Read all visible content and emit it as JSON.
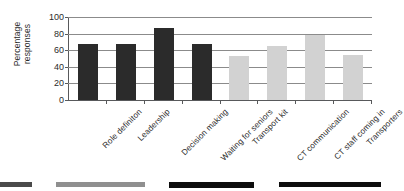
{
  "chart_data": {
    "type": "bar",
    "title": "",
    "subtitle": "",
    "xlabel": "",
    "ylabel": "Percentage\nresponses",
    "ylim": [
      0,
      100
    ],
    "yticks": [
      0,
      20,
      40,
      60,
      80,
      100
    ],
    "grid": true,
    "legend": "none",
    "categories": [
      "Role definiton",
      "Leadership",
      "Decision making",
      "Waiting for seniors",
      "Transport kit",
      "CT communication",
      "CT staff coming in",
      "Transporters"
    ],
    "values": [
      67,
      67,
      87,
      67,
      53,
      65,
      78,
      54
    ],
    "bar_colors": [
      "#2b2b2b",
      "#2b2b2b",
      "#2b2b2b",
      "#2b2b2b",
      "#d2d2d2",
      "#d2d2d2",
      "#d2d2d2",
      "#d2d2d2"
    ],
    "series": [
      {
        "name": "Percentage responses",
        "values": [
          67,
          67,
          87,
          67,
          53,
          65,
          78,
          54
        ]
      }
    ]
  },
  "axis": {
    "y_title": "Percentage\nresponses",
    "tick_labels": [
      "100",
      "80",
      "60",
      "40",
      "20",
      "0"
    ]
  },
  "colors": {
    "dark_bar": "#2b2b2b",
    "light_bar": "#d2d2d2",
    "gridline": "#8b8b8b",
    "axis": "#58595b",
    "text": "#2b2b2b",
    "background": "#ffffff"
  },
  "bottom_strip": {
    "note": "cropped top edge of the following figure",
    "bars": [
      {
        "left": 0,
        "width": 97,
        "color": "#4a4a4a",
        "height": 5
      },
      {
        "left": 168,
        "width": 266,
        "color": "#8f8f8f",
        "height": 5
      },
      {
        "left": 505,
        "width": 255,
        "color": "#0d0d0d",
        "height": 6
      },
      {
        "left": 835,
        "width": 305,
        "color": "#0d0d0d",
        "height": 5
      }
    ]
  }
}
